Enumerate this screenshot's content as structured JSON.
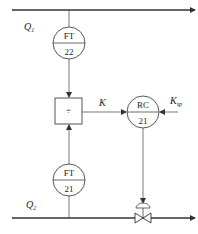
{
  "diagram": {
    "type": "process-control-ratio-loop",
    "streams": [
      {
        "id": "q1",
        "label": "Q",
        "sub": "1"
      },
      {
        "id": "q2",
        "label": "Q",
        "sub": "2"
      }
    ],
    "instruments": [
      {
        "id": "ft22",
        "tag": "FT",
        "number": "22"
      },
      {
        "id": "ft21",
        "tag": "FT",
        "number": "21"
      },
      {
        "id": "rc21",
        "tag": "RC",
        "number": "21"
      }
    ],
    "divider": {
      "symbol": "÷"
    },
    "signals": {
      "ratio": "K",
      "setpoint": {
        "label": "K",
        "sub": "sp"
      }
    }
  }
}
